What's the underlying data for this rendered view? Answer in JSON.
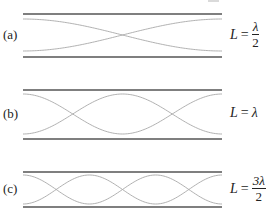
{
  "figure": {
    "top_fragment": "",
    "panels": [
      {
        "id": "a",
        "label": "(a)",
        "equation": {
          "lhs": "L",
          "op": "=",
          "num": "λ",
          "den": "2",
          "is_fraction": true
        },
        "half_wavelengths": 1,
        "wall_top_y": 14,
        "wall_bottom_y": 57,
        "wave_top_y": 19,
        "wave_bottom_y": 51,
        "label_y": 35,
        "eq_y": 36
      },
      {
        "id": "b",
        "label": "(b)",
        "equation": {
          "lhs": "L",
          "op": "=",
          "value": "λ",
          "is_fraction": false
        },
        "half_wavelengths": 2,
        "wall_top_y": 90,
        "wall_bottom_y": 139,
        "wave_top_y": 94,
        "wave_bottom_y": 134,
        "label_y": 114,
        "eq_y": 114
      },
      {
        "id": "c",
        "label": "(c)",
        "equation": {
          "lhs": "L",
          "op": "=",
          "num": "3λ",
          "den": "2",
          "is_fraction": true
        },
        "half_wavelengths": 3,
        "wall_top_y": 172,
        "wall_bottom_y": 207,
        "wave_top_y": 175,
        "wave_bottom_y": 204,
        "label_y": 189,
        "eq_y": 190
      }
    ],
    "x_start": 23,
    "x_end": 222,
    "colors": {
      "wall": "#555555",
      "wave": "#a8a8a8",
      "text": "#222222"
    }
  }
}
